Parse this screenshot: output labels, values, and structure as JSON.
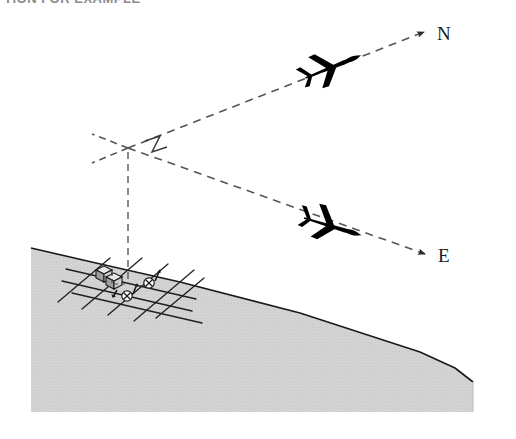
{
  "figure": {
    "kind": "technical-illustration",
    "title_cut_off": "TION FOR EXAMPLE",
    "caption": "",
    "background_color": "#ffffff",
    "ink_color": "#1a1a1a",
    "terrain_fill": "#d2d2d2",
    "terrain_edge": "#1a1a1a",
    "dash_color": "#555555",
    "aircraft_color": "#000000"
  },
  "labels": {
    "north": "N",
    "east": "E"
  },
  "bearing_lines": [
    {
      "name": "north-bearing",
      "label": "N",
      "from": [
        128,
        148
      ],
      "to": [
        424,
        32
      ],
      "style": "dashed",
      "arrowhead": true
    },
    {
      "name": "east-bearing",
      "label": "E",
      "from": [
        128,
        148
      ],
      "to": [
        425,
        254
      ],
      "style": "dashed",
      "arrowhead": true
    },
    {
      "name": "west-tick",
      "label": "",
      "from": [
        128,
        148
      ],
      "to": [
        92,
        134
      ],
      "style": "dashed",
      "arrowhead": false
    },
    {
      "name": "southwest-tick",
      "label": "",
      "from": [
        128,
        148
      ],
      "to": [
        92,
        163
      ],
      "style": "dashed",
      "arrowhead": false
    },
    {
      "name": "vertical-drop",
      "label": "",
      "from": [
        128,
        148
      ],
      "to": [
        128,
        281
      ],
      "style": "dashed",
      "arrowhead": false
    }
  ],
  "vertex": {
    "name": "observation-vertex",
    "x": 128,
    "y": 148,
    "right_angle_marker": true
  },
  "aircraft": [
    {
      "name": "aircraft-north",
      "x": 333,
      "y": 66,
      "rotation": -21,
      "scale": 1.0
    },
    {
      "name": "aircraft-east",
      "x": 333,
      "y": 226,
      "rotation": 18,
      "scale": 1.0
    }
  ],
  "terrain": {
    "name": "hillside",
    "outline_points": "31,283 31,412 473,412 473,382 455,368 420,352 300,313 180,282 96,263 31,248",
    "ridge_points": "31,248 96,263 180,282 300,313 420,352 455,368 473,382"
  },
  "site": {
    "name": "street-grid-site",
    "center": [
      128,
      287
    ],
    "buildings": 2,
    "markers": 3,
    "grid_lines": 8
  }
}
